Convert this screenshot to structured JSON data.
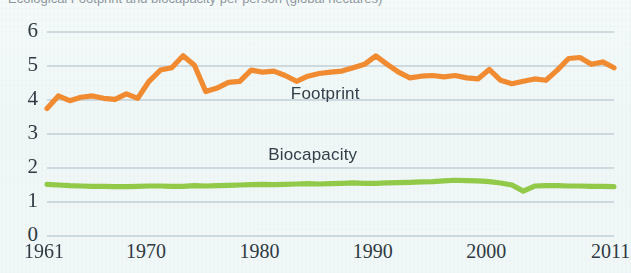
{
  "figure": {
    "background_color": "#eef5f5",
    "clipped_top_caption": "Ecological Footprint and biocapacity per person (global hectares)"
  },
  "chart_data": {
    "type": "line",
    "title": "",
    "xlabel": "",
    "ylabel": "",
    "xlim": [
      1961,
      2011
    ],
    "ylim": [
      0,
      6
    ],
    "grid": true,
    "legend_position": "inline-annotation",
    "y_ticks": [
      "0",
      "1",
      "2",
      "3",
      "4",
      "5",
      "6"
    ],
    "y_tick_values": [
      0,
      1,
      2,
      3,
      4,
      5,
      6
    ],
    "x_ticks": [
      "1961",
      "1970",
      "1980",
      "1990",
      "2000",
      "2011"
    ],
    "x_tick_values": [
      1961,
      1970,
      1980,
      1990,
      2000,
      2011
    ],
    "x": [
      1961,
      1962,
      1963,
      1964,
      1965,
      1966,
      1967,
      1968,
      1969,
      1970,
      1971,
      1972,
      1973,
      1974,
      1975,
      1976,
      1977,
      1978,
      1979,
      1980,
      1981,
      1982,
      1983,
      1984,
      1985,
      1986,
      1987,
      1988,
      1989,
      1990,
      1991,
      1992,
      1993,
      1994,
      1995,
      1996,
      1997,
      1998,
      1999,
      2000,
      2001,
      2002,
      2003,
      2004,
      2005,
      2006,
      2007,
      2008,
      2009,
      2010,
      2011
    ],
    "series": [
      {
        "name": "Footprint",
        "color": "#f0862a",
        "label_position": {
          "x": 1982.5,
          "y": 4.15
        },
        "values": [
          3.75,
          4.12,
          3.98,
          4.08,
          4.12,
          4.05,
          4.02,
          4.18,
          4.05,
          4.55,
          4.88,
          4.95,
          5.3,
          5.02,
          4.25,
          4.35,
          4.52,
          4.55,
          4.88,
          4.82,
          4.85,
          4.72,
          4.55,
          4.7,
          4.78,
          4.82,
          4.85,
          4.95,
          5.05,
          5.3,
          5.05,
          4.82,
          4.65,
          4.7,
          4.72,
          4.68,
          4.72,
          4.65,
          4.62,
          4.9,
          4.58,
          4.48,
          4.55,
          4.62,
          4.58,
          4.88,
          5.22,
          5.25,
          5.05,
          5.12,
          4.95
        ]
      },
      {
        "name": "Biocapacity",
        "color": "#8cc63f",
        "label_position": {
          "x": 1980.5,
          "y": 2.35
        },
        "values": [
          1.52,
          1.5,
          1.48,
          1.47,
          1.46,
          1.46,
          1.45,
          1.45,
          1.46,
          1.47,
          1.47,
          1.46,
          1.46,
          1.48,
          1.47,
          1.48,
          1.49,
          1.5,
          1.51,
          1.52,
          1.51,
          1.52,
          1.53,
          1.54,
          1.53,
          1.54,
          1.55,
          1.56,
          1.55,
          1.55,
          1.56,
          1.57,
          1.58,
          1.59,
          1.6,
          1.62,
          1.64,
          1.63,
          1.62,
          1.6,
          1.56,
          1.5,
          1.32,
          1.47,
          1.48,
          1.48,
          1.47,
          1.47,
          1.46,
          1.46,
          1.45
        ]
      }
    ]
  }
}
